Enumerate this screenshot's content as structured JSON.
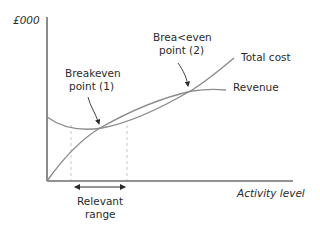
{
  "diagram": {
    "type": "breakeven-chart",
    "y_axis_label": "£000",
    "x_axis_label": "Activity level",
    "curves": [
      {
        "name": "Total cost",
        "label": "Total cost"
      },
      {
        "name": "Revenue",
        "label": "Revenue"
      }
    ],
    "annotations": {
      "bep1_line1": "Breakeven",
      "bep1_line2": "point (1)",
      "bep2_line1": "Brea<even",
      "bep2_line2": "point (2)",
      "range_line1": "Relevant",
      "range_line2": "range"
    },
    "colors": {
      "axis": "#6e6e6e",
      "curve": "#8c8c8c",
      "dashed": "#c8c8c8",
      "text": "#2b2b2b"
    }
  }
}
